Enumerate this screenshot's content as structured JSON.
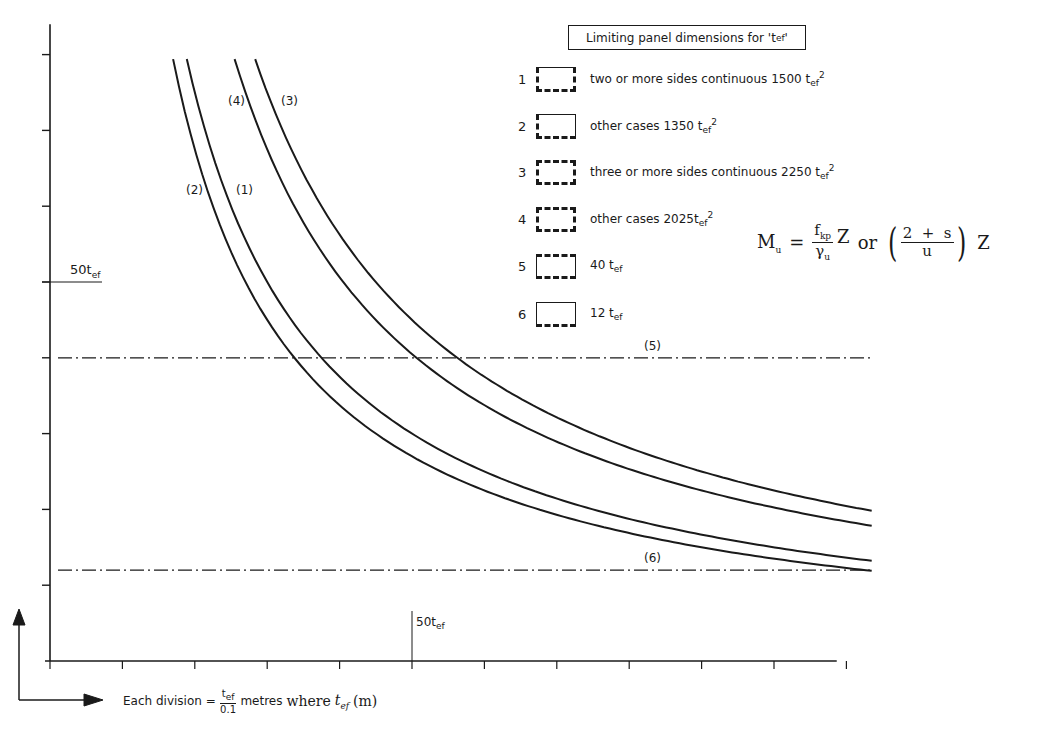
{
  "chart_data": {
    "type": "line",
    "xlabel": "Each division = t_ef / 0.1 metres where t_ef (m)",
    "ylabel": "",
    "x_unit": "divisions (1 division = 10 t_ef)",
    "y_unit": "divisions (1 division = 10 t_ef)",
    "xlim": [
      0,
      11.35
    ],
    "ylim": [
      0,
      8.4
    ],
    "x_ticks": [
      0,
      1,
      2,
      3,
      4,
      5,
      6,
      7,
      8,
      9,
      10,
      11
    ],
    "y_ticks": [
      0,
      1,
      2,
      3,
      4,
      5,
      6,
      7,
      8
    ],
    "x_marker": {
      "value": 5,
      "label": "50t_ef"
    },
    "y_marker": {
      "value": 5,
      "label": "50t_ef"
    },
    "grid": false,
    "series": [
      {
        "id": "1",
        "name": "two or more sides continuous 1500 t_ef^2",
        "curve_label": "(1)",
        "constant_tef2": 1500,
        "type": "hyperbola",
        "x": [
          1.89,
          2,
          2.5,
          3,
          3.75,
          4,
          5,
          6,
          7,
          8,
          9,
          10,
          11.35
        ],
        "y": [
          7.94,
          7.5,
          6.0,
          5.0,
          4.0,
          3.75,
          3.0,
          2.5,
          2.14,
          1.88,
          1.67,
          1.5,
          1.32
        ]
      },
      {
        "id": "2",
        "name": "other cases 1350 t_ef^2",
        "curve_label": "(2)",
        "constant_tef2": 1350,
        "type": "hyperbola",
        "x": [
          1.7,
          2,
          2.5,
          3,
          3.375,
          4,
          5,
          6,
          7,
          8,
          9,
          10,
          11.35
        ],
        "y": [
          7.94,
          6.75,
          5.4,
          4.5,
          4.0,
          3.375,
          2.7,
          2.25,
          1.93,
          1.69,
          1.5,
          1.35,
          1.19
        ]
      },
      {
        "id": "3",
        "name": "three or more sides continuous 2250 t_ef^2",
        "curve_label": "(3)",
        "constant_tef2": 2250,
        "type": "hyperbola",
        "x": [
          2.83,
          3,
          4,
          5,
          5.625,
          6,
          7,
          8,
          9,
          10,
          11.35
        ],
        "y": [
          7.94,
          7.5,
          5.625,
          4.5,
          4.0,
          3.75,
          3.21,
          2.81,
          2.5,
          2.25,
          1.98
        ]
      },
      {
        "id": "4",
        "name": "other cases 2025 t_ef^2",
        "curve_label": "(4)",
        "constant_tef2": 2025,
        "type": "hyperbola",
        "x": [
          2.55,
          3,
          4,
          5,
          5.06,
          6,
          7,
          8,
          9,
          10,
          11.35
        ],
        "y": [
          7.94,
          6.75,
          5.06,
          4.05,
          4.0,
          3.375,
          2.89,
          2.53,
          2.25,
          2.03,
          1.78
        ]
      },
      {
        "id": "5",
        "name": "40 t_ef",
        "curve_label": "(5)",
        "type": "horizontal",
        "y_value": 4.0
      },
      {
        "id": "6",
        "name": "12 t_ef",
        "curve_label": "(6)",
        "type": "horizontal",
        "y_value": 1.2
      }
    ],
    "annotations": [
      "M_u = (f_kp / γ_u) Z  or  ((2 + s) / u) Z"
    ]
  },
  "legend": {
    "title": "Limiting panel dimensions for 't",
    "title_sub": "ef",
    "title_end": "'",
    "items": [
      {
        "num": "1",
        "text": "two or more sides continuous 1500 t",
        "sub": "ef",
        "sup": "2"
      },
      {
        "num": "2",
        "text": "other cases 1350 t",
        "sub": "ef",
        "sup": "2"
      },
      {
        "num": "3",
        "text": "three or more sides continuous 2250 t",
        "sub": "ef",
        "sup": "2"
      },
      {
        "num": "4",
        "text": "other cases 2025t",
        "sub": "ef",
        "sup": "2"
      },
      {
        "num": "5",
        "text": "40 t",
        "sub": "ef",
        "sup": ""
      },
      {
        "num": "6",
        "text": "12 t",
        "sub": "ef",
        "sup": ""
      }
    ]
  },
  "curve_labels": {
    "c1": "(1)",
    "c2": "(2)",
    "c3": "(3)",
    "c4": "(4)",
    "c5": "(5)",
    "c6": "(6)"
  },
  "axis_labels": {
    "y_marker": "50t",
    "y_marker_sub": "ef",
    "x_marker": "50t",
    "x_marker_sub": "ef",
    "xlabel_prefix": "Each division =",
    "xlabel_frac_num": "t",
    "xlabel_frac_num_sub": "ef",
    "xlabel_frac_den": "0.1",
    "xlabel_mid": "metres",
    "xlabel_where": "where",
    "xlabel_t": "t",
    "xlabel_t_sub": "ef",
    "xlabel_unit": "(m)"
  },
  "formula": {
    "lhs": "M",
    "lhs_sub": "u",
    "eq": "=",
    "f_num": "f",
    "f_num_sub": "kp",
    "f_den": "γ",
    "f_den_sub": "u",
    "z1": "Z",
    "or": "or",
    "p_num": "2  +  s",
    "p_den": "u",
    "z2": "Z"
  }
}
